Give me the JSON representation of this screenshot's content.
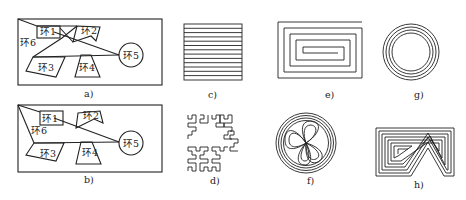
{
  "figure": {
    "panels": [
      {
        "id": "a",
        "caption": "a)",
        "kind": "ring-network",
        "rings": [
          "环1",
          "环2",
          "环3",
          "环4",
          "环5",
          "环6"
        ]
      },
      {
        "id": "b",
        "caption": "b)",
        "kind": "ring-network",
        "rings": [
          "环1",
          "环2",
          "环3",
          "环4",
          "环5",
          "环6"
        ]
      },
      {
        "id": "c",
        "caption": "c)",
        "kind": "parallel-lines",
        "line_count": 13
      },
      {
        "id": "d",
        "caption": "d)",
        "kind": "hilbert-curve"
      },
      {
        "id": "e",
        "caption": "e)",
        "kind": "rectangular-spiral"
      },
      {
        "id": "f",
        "caption": "f)",
        "kind": "circular-fractal-paths"
      },
      {
        "id": "g",
        "caption": "g)",
        "kind": "concentric-circles",
        "ring_count": 4
      },
      {
        "id": "h",
        "caption": "h)",
        "kind": "contour-offset-paths"
      }
    ]
  },
  "labels": {
    "a": {
      "r1": "环1",
      "r2": "环2",
      "r3": "环3",
      "r4": "环4",
      "r5": "环5",
      "r6": "环6"
    },
    "b": {
      "r1": "环1",
      "r2": "环2",
      "r3": "环3",
      "r4": "环4",
      "r5": "环5",
      "r6": "环6"
    }
  },
  "captions": {
    "a": "a)",
    "b": "b)",
    "c": "c)",
    "d": "d)",
    "e": "e)",
    "f": "f)",
    "g": "g)",
    "h": "h)"
  },
  "colors": {
    "ink": "#222222",
    "background": "#ffffff"
  }
}
